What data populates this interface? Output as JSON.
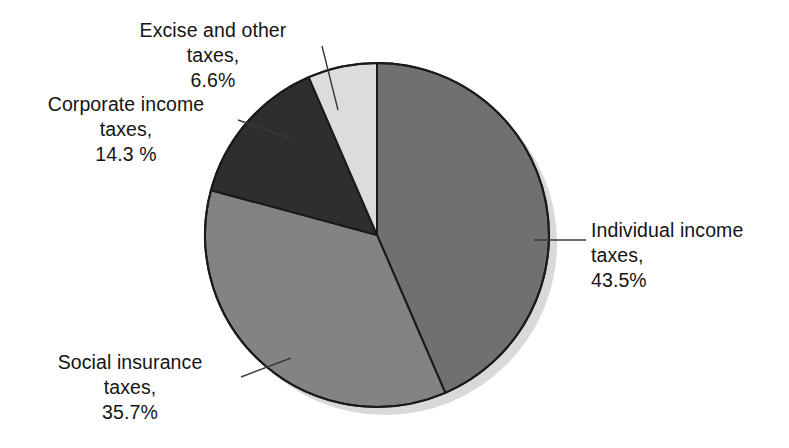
{
  "chart_data": {
    "type": "pie",
    "title": "",
    "subtitle": "",
    "xlabel": "",
    "ylabel": "",
    "legend_position": "none",
    "grid": false,
    "start_angle_deg": 0,
    "direction": "clockwise",
    "categories": [
      "Individual income taxes",
      "Social insurance taxes",
      "Corporate income taxes",
      "Excise and other taxes"
    ],
    "values": [
      43.5,
      35.7,
      14.3,
      6.6
    ],
    "value_unit": "%",
    "slices": [
      {
        "name": "Individual income taxes",
        "label_line1": "Individual income",
        "label_line2": "taxes,",
        "label_line3": "43.5%",
        "value": 43.5,
        "value_text": "43.5%",
        "color": "#707070",
        "start_deg": 0.0,
        "end_deg": 156.6
      },
      {
        "name": "Social insurance taxes",
        "label_line1": "Social insurance",
        "label_line2": "taxes,",
        "label_line3": "35.7%",
        "value": 35.7,
        "value_text": "35.7%",
        "color": "#838383",
        "start_deg": 156.6,
        "end_deg": 285.1
      },
      {
        "name": "Corporate income taxes",
        "label_line1": "Corporate income",
        "label_line2": "taxes,",
        "label_line3": "14.3 %",
        "value": 14.3,
        "value_text": "14.3 %",
        "color": "#2e2e2e",
        "start_deg": 285.1,
        "end_deg": 336.6
      },
      {
        "name": "Excise and other taxes",
        "label_line1": "Excise and other",
        "label_line2": "taxes,",
        "label_line3": "6.6%",
        "value": 6.6,
        "value_text": "6.6%",
        "color": "#dcdcdc",
        "start_deg": 336.6,
        "end_deg": 360.0
      }
    ],
    "colors": {
      "individual_income": "#707070",
      "social_insurance": "#838383",
      "corporate_income": "#2e2e2e",
      "excise_other": "#dcdcdc",
      "outline": "#1a1a1a",
      "leader_line": "#3a3a3a",
      "text": "#141414",
      "background": "#ffffff",
      "shadow": "#d9d9d9"
    }
  }
}
